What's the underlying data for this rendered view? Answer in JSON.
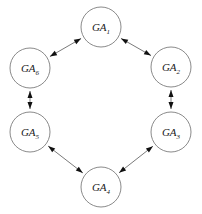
{
  "diagram": {
    "type": "directed-graph",
    "background_color": "#ffffff",
    "node_fill_color": "#ffffff",
    "node_stroke_color": "#8a8a8a",
    "edge_color": "#7a7a7a",
    "arrowhead_color": "#111111",
    "node_radius": 20,
    "nodes": [
      {
        "id": "GA1",
        "base": "GA",
        "subscript": "1",
        "label": "GA1",
        "cx": 101,
        "cy": 27,
        "position": "top"
      },
      {
        "id": "GA2",
        "base": "GA",
        "subscript": "2",
        "label": "GA2",
        "cx": 171,
        "cy": 67,
        "position": "upper-right"
      },
      {
        "id": "GA3",
        "base": "GA",
        "subscript": "3",
        "label": "GA3",
        "cx": 171,
        "cy": 132,
        "position": "lower-right"
      },
      {
        "id": "GA4",
        "base": "GA",
        "subscript": "4",
        "label": "GA4",
        "cx": 101,
        "cy": 187,
        "position": "bottom"
      },
      {
        "id": "GA5",
        "base": "GA",
        "subscript": "5",
        "label": "GA5",
        "cx": 30,
        "cy": 132,
        "position": "lower-left"
      },
      {
        "id": "GA6",
        "base": "GA",
        "subscript": "6",
        "label": "GA6",
        "cx": 30,
        "cy": 68,
        "position": "upper-left"
      }
    ],
    "edges": [
      {
        "from": "GA1",
        "to": "GA2",
        "direction": "both",
        "name": "edge-ga1-ga2"
      },
      {
        "from": "GA2",
        "to": "GA3",
        "direction": "both",
        "name": "edge-ga2-ga3"
      },
      {
        "from": "GA3",
        "to": "GA4",
        "direction": "both",
        "name": "edge-ga3-ga4"
      },
      {
        "from": "GA4",
        "to": "GA5",
        "direction": "both",
        "name": "edge-ga4-ga5"
      },
      {
        "from": "GA5",
        "to": "GA6",
        "direction": "both",
        "name": "edge-ga5-ga6"
      },
      {
        "from": "GA6",
        "to": "GA1",
        "direction": "both",
        "name": "edge-ga6-ga1"
      }
    ]
  }
}
